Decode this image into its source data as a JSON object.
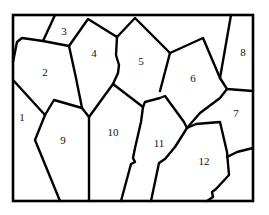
{
  "diagram": {
    "type": "region-map",
    "colors": {
      "line": "#000000",
      "background": "#ffffff",
      "label": "#111111"
    },
    "regions": [
      {
        "id": 1,
        "label": "1",
        "x": 22,
        "y": 117
      },
      {
        "id": 2,
        "label": "2",
        "x": 45,
        "y": 72
      },
      {
        "id": 3,
        "label": "3",
        "x": 64,
        "y": 31
      },
      {
        "id": 4,
        "label": "4",
        "x": 94,
        "y": 53
      },
      {
        "id": 5,
        "label": "5",
        "x": 141,
        "y": 61
      },
      {
        "id": 6,
        "label": "6",
        "x": 193,
        "y": 78
      },
      {
        "id": 7,
        "label": "7",
        "x": 236,
        "y": 113
      },
      {
        "id": 8,
        "label": "8",
        "x": 243,
        "y": 52
      },
      {
        "id": 9,
        "label": "9",
        "x": 63,
        "y": 140
      },
      {
        "id": 10,
        "label": "10",
        "x": 113,
        "y": 132
      },
      {
        "id": 11,
        "label": "11",
        "x": 159,
        "y": 143
      },
      {
        "id": 12,
        "label": "12",
        "x": 204,
        "y": 161
      }
    ]
  }
}
